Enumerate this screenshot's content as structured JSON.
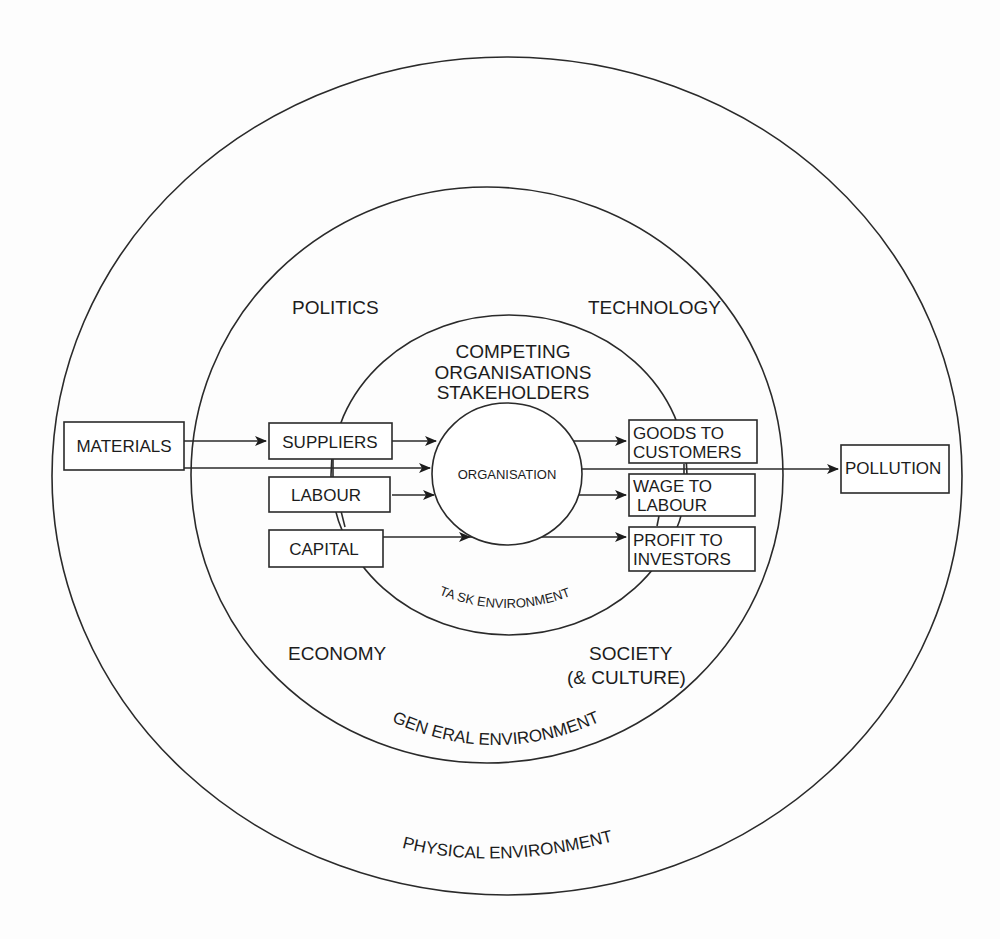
{
  "diagram": {
    "rings": {
      "physical": {
        "label": "PHYSICAL ENVIRONMENT"
      },
      "general": {
        "label": "GEN ERAL ENVIRONMENT"
      },
      "task": {
        "label": "TA SK ENVIRONMENT"
      },
      "core": {
        "label": "ORGANISATION"
      }
    },
    "general_factors": {
      "politics": "POLITICS",
      "technology": "TECHNOLOGY",
      "economy": "ECONOMY",
      "society_line1": "SOCIETY",
      "society_line2": "(& CULTURE)"
    },
    "task_heading": {
      "line1": "COMPETING",
      "line2": "ORGANISATIONS",
      "line3": "STAKEHOLDERS"
    },
    "inputs": {
      "materials": "MATERIALS",
      "suppliers": "SUPPLIERS",
      "labour": "LABOUR",
      "capital": "CAPITAL"
    },
    "outputs": {
      "goods_line1": "GOODS TO",
      "goods_line2": "CUSTOMERS",
      "wage_line1": "WAGE TO",
      "wage_line2": "LABOUR",
      "profit_line1": "PROFIT TO",
      "profit_line2": "INVESTORS",
      "pollution": "POLLUTION"
    },
    "flows": [
      {
        "from": "MATERIALS",
        "to": "SUPPLIERS"
      },
      {
        "from": "MATERIALS",
        "to": "ORGANISATION"
      },
      {
        "from": "SUPPLIERS",
        "to": "ORGANISATION"
      },
      {
        "from": "LABOUR",
        "to": "ORGANISATION"
      },
      {
        "from": "CAPITAL",
        "to": "ORGANISATION"
      },
      {
        "from": "ORGANISATION",
        "to": "GOODS TO CUSTOMERS"
      },
      {
        "from": "ORGANISATION",
        "to": "POLLUTION"
      },
      {
        "from": "ORGANISATION",
        "to": "WAGE TO LABOUR"
      },
      {
        "from": "ORGANISATION",
        "to": "PROFIT TO INVESTORS"
      }
    ]
  }
}
